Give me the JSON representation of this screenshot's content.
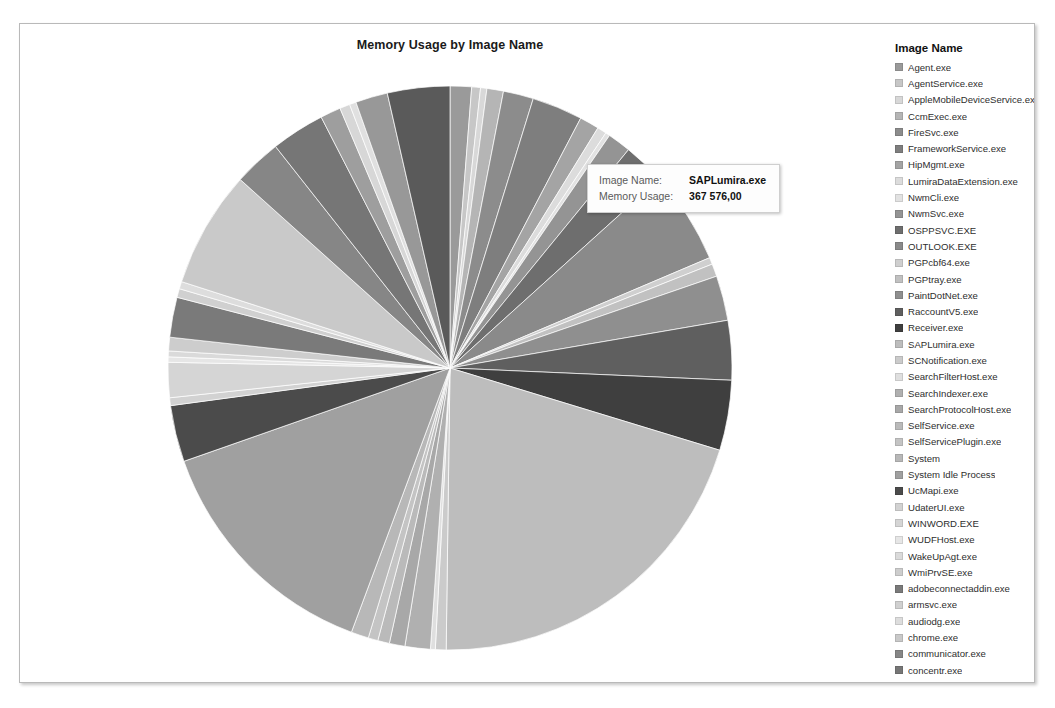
{
  "chart_title": "Memory Usage by Image Name",
  "tooltip": {
    "key_image_name": "Image Name:",
    "value_image_name": "SAPLumira.exe",
    "key_memory_usage": "Memory Usage:",
    "value_memory_usage": "367 576,00"
  },
  "legend": {
    "title": "Image Name"
  },
  "chart_data": {
    "type": "pie",
    "title": "Memory Usage by Image Name",
    "measure": "Memory Usage",
    "dimension": "Image Name",
    "legend_position": "right",
    "grid": false,
    "highlighted": "SAPLumira.exe",
    "highlighted_value": "367 576,00",
    "categories": [
      "Agent.exe",
      "AgentService.exe",
      "AppleMobileDeviceService.exe",
      "CcmExec.exe",
      "FireSvc.exe",
      "FrameworkService.exe",
      "HipMgmt.exe",
      "LumiraDataExtension.exe",
      "NwmCli.exe",
      "NwmSvc.exe",
      "OSPPSVC.EXE",
      "OUTLOOK.EXE",
      "PGPcbf64.exe",
      "PGPtray.exe",
      "PaintDotNet.exe",
      "RaccountV5.exe",
      "Receiver.exe",
      "SAPLumira.exe",
      "SCNotification.exe",
      "SearchFilterHost.exe",
      "SearchIndexer.exe",
      "SearchProtocolHost.exe",
      "SelfService.exe",
      "SelfServicePlugin.exe",
      "System",
      "System Idle Process",
      "UcMapi.exe",
      "UdaterUI.exe",
      "WINWORD.EXE",
      "WUDFHost.exe",
      "WakeUpAgt.exe",
      "WmiPrvSE.exe",
      "adobeconnectaddin.exe",
      "armsvc.exe",
      "audiodg.exe",
      "chrome.exe",
      "communicator.exe",
      "concentr.exe",
      "conhost.exe",
      "csrss.exe",
      "discagnt.exe",
      "dllhost.exe",
      "dwm.exe"
    ],
    "values": [
      22000,
      9000,
      6500,
      17000,
      31000,
      52000,
      20000,
      9500,
      4500,
      24000,
      43000,
      95000,
      7000,
      13000,
      46000,
      61000,
      72000,
      367576,
      11000,
      5000,
      26000,
      16000,
      12000,
      10000,
      18000,
      250000,
      58000,
      8000,
      36000,
      5500,
      6000,
      14000,
      41000,
      9000,
      7500,
      120000,
      49000,
      55000,
      21000,
      10500,
      6800,
      33000,
      64000
    ],
    "colors": [
      "#9a9a9a",
      "#c7c7c7",
      "#d8d8d8",
      "#b5b5b5",
      "#8c8c8c",
      "#7e7e7e",
      "#a4a4a4",
      "#dcdcdc",
      "#e2e2e2",
      "#949494",
      "#6e6e6e",
      "#8a8a8a",
      "#cfcfcf",
      "#c1c1c1",
      "#8f8f8f",
      "#5f5f5f",
      "#3f3f3f",
      "#bdbdbd",
      "#cbcbcb",
      "#dfdfdf",
      "#b0b0b0",
      "#a8a8a8",
      "#bababa",
      "#c4c4c4",
      "#b8b8b8",
      "#a0a0a0",
      "#4b4b4b",
      "#d2d2d2",
      "#d5d5d5",
      "#e6e6e6",
      "#dadada",
      "#cdcdcd",
      "#7a7a7a",
      "#d0d0d0",
      "#dddddd",
      "#c9c9c9",
      "#868686",
      "#767676",
      "#9e9e9e",
      "#d7d7d7",
      "#e0e0e0",
      "#989898",
      "#5a5a5a"
    ]
  }
}
